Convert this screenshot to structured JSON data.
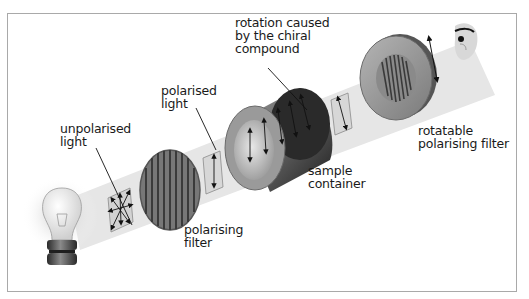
{
  "diagram": {
    "labels": {
      "rotation": "rotation caused\nby the chiral\ncompound",
      "polarised_light": "polarised\nlight",
      "unpolarised_light": "unpolarised\nlight",
      "polarising_filter": "polarising\nfilter",
      "sample_container": "sample\ncontainer",
      "rotatable_filter": "rotatable\npolarising filter"
    },
    "components": [
      {
        "id": "light-bulb",
        "name": "light source"
      },
      {
        "id": "unpolarised-light-panel",
        "name": "unpolarised light"
      },
      {
        "id": "polarising-filter",
        "name": "polarising filter"
      },
      {
        "id": "polarised-light-panel",
        "name": "polarised light"
      },
      {
        "id": "sample-container",
        "name": "sample container"
      },
      {
        "id": "rotated-light-panel",
        "name": "rotated polarised light"
      },
      {
        "id": "rotatable-polarising-filter",
        "name": "rotatable polarising filter"
      },
      {
        "id": "observer-eye",
        "name": "observer"
      }
    ],
    "colors": {
      "beam": "#e4e4e4",
      "frame_border": "#a9a9a9",
      "cylinder_dark": "#3a3a3a",
      "cylinder_light": "#8c8c8c",
      "filter_face": "#9a9a9a",
      "text": "#1a1a1a"
    }
  }
}
